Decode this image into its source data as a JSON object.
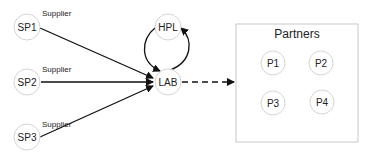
{
  "diagram": {
    "suppliers": [
      {
        "id": "SP1",
        "label": "SP1",
        "tag": "Supplier"
      },
      {
        "id": "SP2",
        "label": "SP2",
        "tag": "Supplier"
      },
      {
        "id": "SP3",
        "label": "SP3",
        "tag": "Supplier"
      }
    ],
    "hpl": {
      "label": "HPL"
    },
    "lab": {
      "label": "LAB"
    },
    "partners": {
      "title": "Partners",
      "members": [
        {
          "label": "P1"
        },
        {
          "label": "P2"
        },
        {
          "label": "P3"
        },
        {
          "label": "P4"
        }
      ]
    },
    "edges": [
      {
        "from": "SP1",
        "to": "LAB",
        "style": "solid"
      },
      {
        "from": "SP2",
        "to": "LAB",
        "style": "solid"
      },
      {
        "from": "SP3",
        "to": "LAB",
        "style": "solid"
      },
      {
        "from": "LAB",
        "to": "HPL",
        "style": "solid"
      },
      {
        "from": "HPL",
        "to": "LAB",
        "style": "solid"
      },
      {
        "from": "LAB",
        "to": "Partners",
        "style": "dashed"
      }
    ]
  }
}
